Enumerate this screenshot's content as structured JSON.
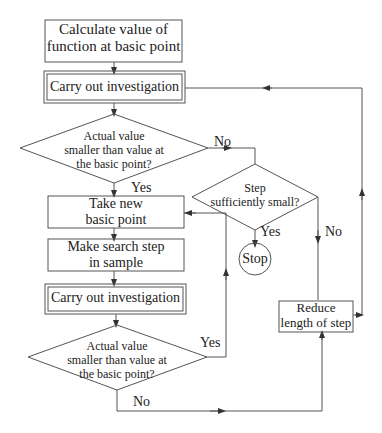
{
  "diagram": {
    "type": "flowchart",
    "nodes": {
      "calc": {
        "label_line1": "Calculate value of",
        "label_line2": "function at basic point",
        "shape": "rectangle"
      },
      "investigate1": {
        "label": "Carry out investigation",
        "shape": "double-rectangle"
      },
      "decision1": {
        "line1": "Actual value",
        "line2": "smaller than value at",
        "line3": "the basic point?",
        "shape": "diamond"
      },
      "step_small": {
        "line1": "Step",
        "line2": "sufficiently small?",
        "shape": "diamond"
      },
      "take_new": {
        "line1": "Take new",
        "line2": "basic point",
        "shape": "rectangle"
      },
      "search_step": {
        "line1": "Make search step",
        "line2": "in sample",
        "shape": "rectangle"
      },
      "investigate2": {
        "label": "Carry out investigation",
        "shape": "double-rectangle"
      },
      "decision2": {
        "line1": "Actual value",
        "line2": "smaller than value at",
        "line3": "the basic point?",
        "shape": "diamond"
      },
      "stop": {
        "label": "Stop",
        "shape": "circle"
      },
      "reduce": {
        "line1": "Reduce",
        "line2": "length of step",
        "shape": "rectangle"
      }
    },
    "edge_labels": {
      "d1_no": "No",
      "d1_yes": "Yes",
      "step_yes": "Yes",
      "step_no": "No",
      "d2_yes": "Yes",
      "d2_no": "No"
    },
    "colors": {
      "line": "#444444",
      "text": "#222222",
      "background": "#ffffff"
    }
  }
}
